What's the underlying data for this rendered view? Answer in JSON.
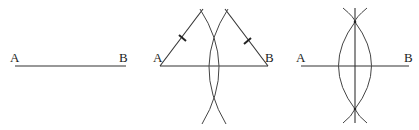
{
  "diagram": {
    "line_color": "#333333",
    "panels": [
      {
        "step": 1,
        "labels": {
          "left": "A",
          "right": "B"
        },
        "segment": {
          "x1": 15,
          "y1": 66,
          "x2": 126,
          "y2": 66
        }
      },
      {
        "step": 2,
        "labels": {
          "left": "A",
          "right": "B"
        },
        "segment": {
          "x1": 160,
          "y1": 66,
          "x2": 268,
          "y2": 66
        },
        "equal_radius_marks": 2
      },
      {
        "step": 3,
        "labels": {
          "left": "A",
          "right": "B"
        },
        "segment": {
          "x1": 301,
          "y1": 66,
          "x2": 409,
          "y2": 66
        },
        "perpendicular_x": 355
      }
    ]
  }
}
